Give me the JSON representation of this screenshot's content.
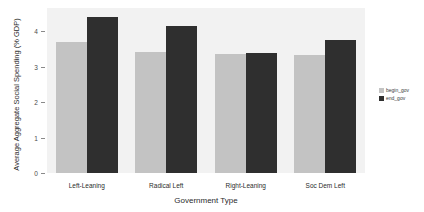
{
  "chart_data": {
    "type": "bar",
    "title": "",
    "xlabel": "Government Type",
    "ylabel": "Average Aggregate Social Spending (% GDP)",
    "categories": [
      "Left-Leaning",
      "Radical Left",
      "Right-Leaning",
      "Soc Dem Left"
    ],
    "series": [
      {
        "name": "begin_gov",
        "color": "#c3c3c3",
        "values": [
          3.7,
          3.4,
          3.35,
          3.32
        ]
      },
      {
        "name": "end_gov",
        "color": "#2f2f2f",
        "values": [
          4.4,
          4.15,
          3.38,
          3.75
        ]
      }
    ],
    "ylim": [
      0,
      4.65
    ],
    "yticks": [
      0,
      1,
      2,
      3,
      4
    ],
    "ytick_labels": [
      "0",
      "1",
      "2",
      "3",
      "4"
    ],
    "grid": false,
    "legend_position": "right",
    "plot_background": "#f2f2f2",
    "figure_background": "#ffffff"
  }
}
